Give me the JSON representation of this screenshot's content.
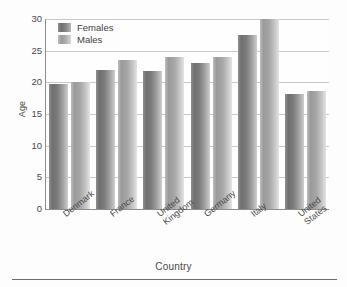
{
  "chart_data": {
    "type": "bar",
    "title": "",
    "xlabel": "Country",
    "ylabel": "Age",
    "ylim": [
      0,
      30
    ],
    "yticks": [
      0,
      5,
      10,
      15,
      20,
      25,
      30
    ],
    "grid": true,
    "legend_position": "top-left",
    "categories": [
      "Denmark",
      "France",
      "United Kingdom",
      "Germany",
      "Italy",
      "United States"
    ],
    "category_label_lines": [
      [
        "Denmark"
      ],
      [
        "France"
      ],
      [
        "United",
        "Kingdom"
      ],
      [
        "Germany"
      ],
      [
        "Italy"
      ],
      [
        "United",
        "States"
      ]
    ],
    "series": [
      {
        "name": "Females",
        "color": "#7d7d7d",
        "values": [
          19.8,
          21.9,
          21.8,
          23.0,
          27.4,
          18.2
        ]
      },
      {
        "name": "Males",
        "color": "#aeaeae",
        "values": [
          20.0,
          23.6,
          24.0,
          24.0,
          30.0,
          18.6
        ]
      }
    ]
  },
  "legend": {
    "items": [
      {
        "label": "Females"
      },
      {
        "label": "Males"
      }
    ]
  },
  "colors": {
    "axis": "#8e8e8e",
    "gridline": "#c9c9c9",
    "text": "#4a4a4a",
    "background": "#fdfdfd",
    "rule": "#6d6d6d"
  }
}
